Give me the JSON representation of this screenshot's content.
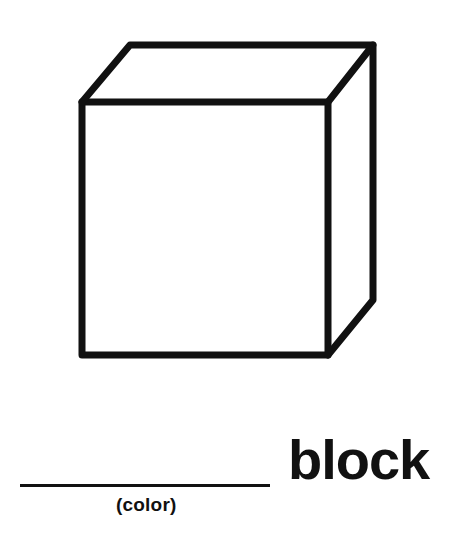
{
  "worksheet": {
    "illustration": {
      "icon": "cube-icon",
      "stroke_color": "#111111"
    },
    "blank_label": "(color)",
    "word": "block"
  }
}
